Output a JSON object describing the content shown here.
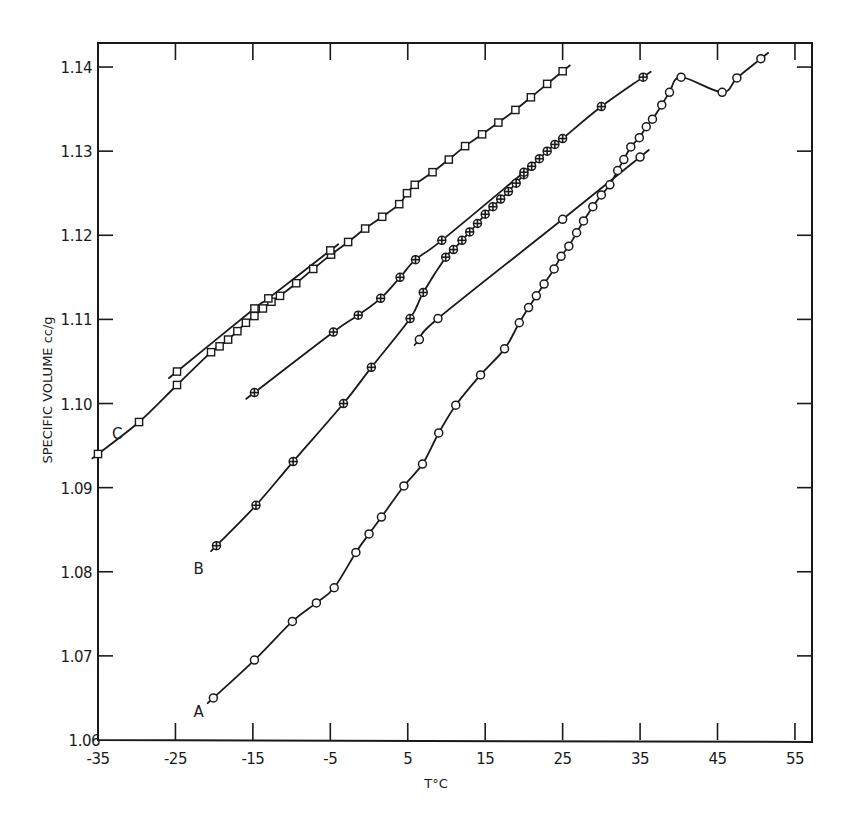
{
  "chart_data": {
    "type": "line",
    "title": "",
    "xlabel": "T°C",
    "ylabel": "SPECIFIC VOLUME  cc/g",
    "xlim": [
      -35,
      57
    ],
    "ylim": [
      1.06,
      1.143
    ],
    "x_ticks": [
      -35,
      -25,
      -15,
      -5,
      5,
      15,
      25,
      35,
      45,
      55
    ],
    "x_tick_labels": [
      "-35",
      "-25",
      "-15",
      "-5",
      "5",
      "15",
      "25",
      "35",
      "45",
      "55"
    ],
    "y_ticks": [
      1.06,
      1.07,
      1.08,
      1.09,
      1.1,
      1.11,
      1.12,
      1.13,
      1.14
    ],
    "y_tick_labels": [
      "1.06",
      "1.07",
      "1.08",
      "1.09",
      "1.10",
      "1.11",
      "1.12",
      "1.13",
      "1.14"
    ],
    "grid": false,
    "legend": "none; curves labeled inline A, B, C",
    "series": [
      {
        "name": "A",
        "marker": "circle",
        "label_pos": [
          -22,
          1.0635
        ],
        "points": [
          [
            -20.1,
            1.065
          ],
          [
            -14.8,
            1.0695
          ],
          [
            -9.9,
            1.0741
          ],
          [
            -6.8,
            1.0763
          ],
          [
            -4.5,
            1.0781
          ],
          [
            -1.7,
            1.0823
          ],
          [
            0.0,
            1.0845
          ],
          [
            1.6,
            1.0865
          ],
          [
            4.5,
            1.0902
          ],
          [
            6.9,
            1.0928
          ],
          [
            9.0,
            1.0965
          ],
          [
            11.2,
            1.0998
          ],
          [
            14.4,
            1.1034
          ],
          [
            17.5,
            1.1065
          ],
          [
            19.4,
            1.1096
          ],
          [
            20.6,
            1.1114
          ],
          [
            21.6,
            1.1128
          ],
          [
            22.6,
            1.1142
          ],
          [
            23.9,
            1.116
          ],
          [
            24.8,
            1.1175
          ],
          [
            25.8,
            1.1187
          ],
          [
            26.8,
            1.1203
          ],
          [
            27.7,
            1.1217
          ],
          [
            28.9,
            1.1234
          ],
          [
            30.0,
            1.1248
          ],
          [
            31.1,
            1.126
          ],
          [
            32.1,
            1.1277
          ],
          [
            32.9,
            1.129
          ],
          [
            33.8,
            1.1305
          ],
          [
            34.9,
            1.1316
          ],
          [
            35.8,
            1.1329
          ],
          [
            36.6,
            1.1338
          ],
          [
            37.8,
            1.1355
          ],
          [
            38.8,
            1.137
          ],
          [
            40.3,
            1.1388
          ],
          [
            45.6,
            1.137
          ],
          [
            47.5,
            1.1387
          ],
          [
            50.6,
            1.141
          ]
        ]
      },
      {
        "name": "A (upper branch)",
        "marker": "circle",
        "points": [
          [
            6.5,
            1.1076
          ],
          [
            8.9,
            1.1101
          ],
          [
            25.0,
            1.1219
          ],
          [
            35.0,
            1.1293
          ]
        ]
      },
      {
        "name": "B",
        "marker": "hatched-circle",
        "label_pos": [
          -22,
          1.0805
        ],
        "points": [
          [
            -19.7,
            1.0831
          ],
          [
            -14.6,
            1.0879
          ],
          [
            -9.8,
            1.0931
          ],
          [
            -3.3,
            1.1
          ],
          [
            0.3,
            1.1043
          ],
          [
            5.3,
            1.1101
          ],
          [
            7.0,
            1.1132
          ],
          [
            9.9,
            1.1174
          ],
          [
            10.9,
            1.1183
          ],
          [
            12.0,
            1.1194
          ],
          [
            13.0,
            1.1204
          ],
          [
            14.0,
            1.1214
          ],
          [
            15.0,
            1.1225
          ],
          [
            16.0,
            1.1234
          ],
          [
            17.0,
            1.1243
          ],
          [
            18.0,
            1.1252
          ],
          [
            19.0,
            1.1262
          ],
          [
            20.0,
            1.1272
          ],
          [
            21.0,
            1.1282
          ],
          [
            22.0,
            1.1291
          ],
          [
            23.0,
            1.13
          ],
          [
            24.0,
            1.1308
          ],
          [
            25.0,
            1.1315
          ],
          [
            30.0,
            1.1353
          ],
          [
            35.4,
            1.1388
          ]
        ]
      },
      {
        "name": "B (upper branch)",
        "marker": "hatched-circle",
        "points": [
          [
            -14.8,
            1.1013
          ],
          [
            -4.6,
            1.1085
          ],
          [
            -1.4,
            1.1105
          ],
          [
            1.5,
            1.1125
          ],
          [
            4.0,
            1.115
          ],
          [
            6.0,
            1.1171
          ],
          [
            9.4,
            1.1194
          ],
          [
            20.0,
            1.1275
          ]
        ]
      },
      {
        "name": "C",
        "marker": "square",
        "label_pos": [
          -32.5,
          1.0965
        ],
        "points": [
          [
            -35.0,
            1.094
          ],
          [
            -29.7,
            1.0978
          ],
          [
            -24.8,
            1.1022
          ],
          [
            -20.4,
            1.1061
          ],
          [
            -19.3,
            1.1068
          ],
          [
            -18.2,
            1.1076
          ],
          [
            -17.0,
            1.1086
          ],
          [
            -15.9,
            1.1096
          ],
          [
            -14.8,
            1.1104
          ],
          [
            -13.7,
            1.1113
          ],
          [
            -12.6,
            1.1121
          ],
          [
            -11.5,
            1.1128
          ],
          [
            -9.4,
            1.1143
          ],
          [
            -7.2,
            1.116
          ],
          [
            -4.9,
            1.1177
          ],
          [
            -2.7,
            1.1192
          ],
          [
            -0.5,
            1.1208
          ],
          [
            1.7,
            1.1222
          ],
          [
            3.9,
            1.1237
          ],
          [
            4.9,
            1.125
          ],
          [
            5.9,
            1.126
          ],
          [
            8.2,
            1.1275
          ],
          [
            10.3,
            1.129
          ],
          [
            12.4,
            1.1306
          ],
          [
            14.6,
            1.132
          ],
          [
            16.7,
            1.1334
          ],
          [
            18.9,
            1.1349
          ],
          [
            20.9,
            1.1364
          ],
          [
            23.0,
            1.138
          ],
          [
            25.0,
            1.1395
          ]
        ]
      },
      {
        "name": "C (upper branch)",
        "marker": "square",
        "points": [
          [
            -24.8,
            1.1038
          ],
          [
            -14.8,
            1.1113
          ],
          [
            -13.0,
            1.1125
          ],
          [
            -5.0,
            1.1182
          ]
        ]
      }
    ],
    "annotations": [
      {
        "text": "A",
        "x": -22,
        "y": 1.0635
      },
      {
        "text": "B",
        "x": -22,
        "y": 1.0805
      },
      {
        "text": "C",
        "x": -32.5,
        "y": 1.0965
      }
    ]
  },
  "labels": {
    "x_axis_title": "T°C",
    "y_axis_title": "SPECIFIC VOLUME  cc/g",
    "curve_a": "A",
    "curve_b": "B",
    "curve_c": "C"
  },
  "colors": {
    "ink": "#1a1a1a",
    "background": "#ffffff"
  }
}
